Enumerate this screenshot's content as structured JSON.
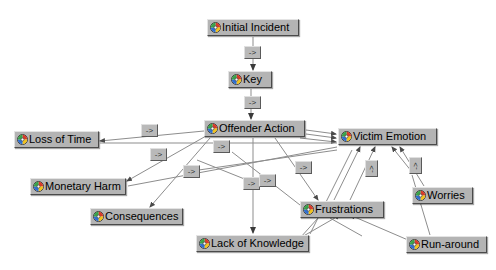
{
  "diagram": {
    "background_color": "#ffffff",
    "node_fill": "#b4b4b4",
    "edge_color": "#808080",
    "label_fill": "#b9b9b9",
    "icon_name": "node-sphere-icon",
    "nodes": [
      {
        "id": "initial_incident",
        "label": "Initial Incident",
        "x": 207,
        "y": 19,
        "w": 92
      },
      {
        "id": "key",
        "label": "Key",
        "x": 228,
        "y": 71,
        "w": 44
      },
      {
        "id": "offender_action",
        "label": "Offender Action",
        "x": 204,
        "y": 120,
        "w": 101
      },
      {
        "id": "victim_emotion",
        "label": "Victim Emotion",
        "x": 338,
        "y": 128,
        "w": 99
      },
      {
        "id": "loss_of_time",
        "label": "Loss of Time",
        "x": 14,
        "y": 131,
        "w": 85
      },
      {
        "id": "monetary_harm",
        "label": "Monetary Harm",
        "x": 30,
        "y": 178,
        "w": 96
      },
      {
        "id": "consequences",
        "label": "Consequences",
        "x": 90,
        "y": 208,
        "w": 93
      },
      {
        "id": "lack_of_knowledge",
        "label": "Lack of Knowledge",
        "x": 196,
        "y": 235,
        "w": 113
      },
      {
        "id": "frustrations",
        "label": "Frustrations",
        "x": 300,
        "y": 201,
        "w": 84
      },
      {
        "id": "worries",
        "label": "Worries",
        "x": 412,
        "y": 187,
        "w": 61
      },
      {
        "id": "run_around",
        "label": "Run-around",
        "x": 406,
        "y": 236,
        "w": 81
      }
    ],
    "edge_labels": [
      {
        "id": "el-incident-key",
        "text": "->",
        "x": 244,
        "y": 46,
        "orientation": "horizontal"
      },
      {
        "id": "el-key-offender",
        "text": "->",
        "x": 244,
        "y": 96,
        "orientation": "horizontal"
      },
      {
        "id": "el-offender-loss",
        "text": "->",
        "x": 141,
        "y": 124,
        "orientation": "horizontal"
      },
      {
        "id": "el-offender-monetary",
        "text": "->",
        "x": 150,
        "y": 148,
        "orientation": "horizontal"
      },
      {
        "id": "el-offender-consequence",
        "text": "->",
        "x": 183,
        "y": 165,
        "orientation": "horizontal"
      },
      {
        "id": "el-offender-down",
        "text": "->",
        "x": 213,
        "y": 140,
        "orientation": "horizontal"
      },
      {
        "id": "el-offender-victim",
        "text": "->",
        "x": 243,
        "y": 177,
        "orientation": "horizontal"
      },
      {
        "id": "el-offender-lack",
        "text": "->",
        "x": 259,
        "y": 174,
        "orientation": "horizontal"
      },
      {
        "id": "el-frustration-victim",
        "text": "->",
        "x": 295,
        "y": 161,
        "orientation": "horizontal"
      },
      {
        "id": "el-victim-left",
        "text": "->",
        "x": 365,
        "y": 160,
        "orientation": "vertical"
      },
      {
        "id": "el-victim-right",
        "text": "->",
        "x": 409,
        "y": 157,
        "orientation": "vertical"
      }
    ],
    "edges": [
      {
        "from": "initial_incident",
        "to": "key"
      },
      {
        "from": "key",
        "to": "offender_action"
      },
      {
        "from": "offender_action",
        "to": "loss_of_time"
      },
      {
        "from": "offender_action",
        "to": "monetary_harm"
      },
      {
        "from": "offender_action",
        "to": "consequences"
      },
      {
        "from": "offender_action",
        "to": "lack_of_knowledge"
      },
      {
        "from": "offender_action",
        "to": "victim_emotion"
      },
      {
        "from": "offender_action",
        "to": "frustrations"
      },
      {
        "from": "frustrations",
        "to": "victim_emotion"
      },
      {
        "from": "worries",
        "to": "victim_emotion"
      },
      {
        "from": "run_around",
        "to": "victim_emotion"
      },
      {
        "from": "run_around",
        "to": "frustrations"
      },
      {
        "from": "lack_of_knowledge",
        "to": "victim_emotion"
      }
    ]
  }
}
